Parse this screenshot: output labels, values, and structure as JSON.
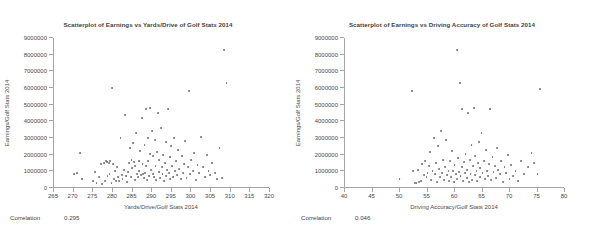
{
  "chart_data": [
    {
      "type": "scatter",
      "title": "Scatterplot of Earnings vs Yards/Drive of Golf Stats 2014",
      "xlabel": "Yards/Drive/Golf Stats 2014",
      "ylabel": "Earnings/Golf Stats 2014",
      "xlim": [
        265,
        320
      ],
      "ylim": [
        0,
        9000000
      ],
      "xticks": [
        265,
        270,
        275,
        280,
        285,
        290,
        295,
        300,
        305,
        310,
        315,
        320
      ],
      "yticks": [
        0,
        1000000,
        2000000,
        3000000,
        4000000,
        5000000,
        6000000,
        7000000,
        8000000,
        9000000
      ],
      "grid": false,
      "legend": "none",
      "correlation_label": "Correlation",
      "correlation_value": "0.295",
      "marker_color": "#6e6e6e",
      "points": [
        [
          270.4,
          820000
        ],
        [
          271.2,
          900000
        ],
        [
          271.9,
          2100000
        ],
        [
          272.4,
          560000
        ],
        [
          275.2,
          420000
        ],
        [
          275.6,
          960000
        ],
        [
          276.1,
          300000
        ],
        [
          276.8,
          690000
        ],
        [
          277.2,
          1450000
        ],
        [
          277.5,
          250000
        ],
        [
          277.9,
          1520000
        ],
        [
          278.2,
          430000
        ],
        [
          278.4,
          1600000
        ],
        [
          278.7,
          1580000
        ],
        [
          278.9,
          700000
        ],
        [
          279.2,
          1500000
        ],
        [
          279.4,
          850000
        ],
        [
          279.6,
          1620000
        ],
        [
          279.9,
          330000
        ],
        [
          280.1,
          6000000
        ],
        [
          280.3,
          1450000
        ],
        [
          280.6,
          560000
        ],
        [
          280.8,
          1000000
        ],
        [
          281.1,
          420000
        ],
        [
          281.4,
          1240000
        ],
        [
          281.6,
          640000
        ],
        [
          281.9,
          400000
        ],
        [
          282.2,
          3000000
        ],
        [
          282.5,
          800000
        ],
        [
          282.7,
          560000
        ],
        [
          283.0,
          1100000
        ],
        [
          283.3,
          4400000
        ],
        [
          283.5,
          700000
        ],
        [
          283.8,
          380000
        ],
        [
          284.1,
          950000
        ],
        [
          284.3,
          1500000
        ],
        [
          284.6,
          2400000
        ],
        [
          284.8,
          640000
        ],
        [
          285.0,
          1700000
        ],
        [
          285.2,
          1180000
        ],
        [
          285.4,
          2700000
        ],
        [
          285.6,
          1550000
        ],
        [
          285.8,
          500000
        ],
        [
          286.0,
          1350000
        ],
        [
          286.2,
          3300000
        ],
        [
          286.4,
          860000
        ],
        [
          286.6,
          640000
        ],
        [
          286.8,
          1650000
        ],
        [
          287.0,
          1000000
        ],
        [
          287.2,
          2200000
        ],
        [
          287.4,
          760000
        ],
        [
          287.6,
          4200000
        ],
        [
          287.8,
          1440000
        ],
        [
          288.0,
          820000
        ],
        [
          288.1,
          600000
        ],
        [
          288.3,
          2600000
        ],
        [
          288.5,
          900000
        ],
        [
          288.6,
          1300000
        ],
        [
          288.8,
          4750000
        ],
        [
          289.0,
          500000
        ],
        [
          289.1,
          3000000
        ],
        [
          289.3,
          1600000
        ],
        [
          289.5,
          720000
        ],
        [
          289.6,
          2050000
        ],
        [
          289.8,
          4800000
        ],
        [
          290.0,
          1100000
        ],
        [
          290.2,
          3450000
        ],
        [
          290.4,
          860000
        ],
        [
          290.5,
          1900000
        ],
        [
          290.7,
          640000
        ],
        [
          290.9,
          2900000
        ],
        [
          291.1,
          1300000
        ],
        [
          291.3,
          480000
        ],
        [
          291.5,
          2150000
        ],
        [
          291.7,
          4500000
        ],
        [
          291.9,
          960000
        ],
        [
          292.1,
          1700000
        ],
        [
          292.3,
          600000
        ],
        [
          292.5,
          3600000
        ],
        [
          292.7,
          1250000
        ],
        [
          292.9,
          820000
        ],
        [
          293.1,
          2000000
        ],
        [
          293.3,
          400000
        ],
        [
          293.5,
          1500000
        ],
        [
          293.7,
          2750000
        ],
        [
          293.9,
          700000
        ],
        [
          294.1,
          1100000
        ],
        [
          294.3,
          4750000
        ],
        [
          294.5,
          900000
        ],
        [
          294.7,
          1850000
        ],
        [
          294.9,
          520000
        ],
        [
          295.1,
          2500000
        ],
        [
          295.3,
          1350000
        ],
        [
          295.5,
          640000
        ],
        [
          295.8,
          3000000
        ],
        [
          296.0,
          1000000
        ],
        [
          296.3,
          1600000
        ],
        [
          296.6,
          760000
        ],
        [
          296.9,
          2300000
        ],
        [
          297.2,
          1150000
        ],
        [
          297.5,
          560000
        ],
        [
          297.8,
          1900000
        ],
        [
          298.1,
          900000
        ],
        [
          298.4,
          1450000
        ],
        [
          298.7,
          2800000
        ],
        [
          299.0,
          600000
        ],
        [
          299.3,
          1250000
        ],
        [
          299.6,
          5800000
        ],
        [
          299.9,
          820000
        ],
        [
          300.2,
          1700000
        ],
        [
          300.6,
          1000000
        ],
        [
          301.0,
          2100000
        ],
        [
          301.4,
          480000
        ],
        [
          301.8,
          1400000
        ],
        [
          302.3,
          900000
        ],
        [
          302.8,
          3050000
        ],
        [
          303.3,
          1250000
        ],
        [
          303.8,
          640000
        ],
        [
          304.2,
          2000000
        ],
        [
          304.6,
          1050000
        ],
        [
          305.1,
          760000
        ],
        [
          305.6,
          1500000
        ],
        [
          306.2,
          900000
        ],
        [
          306.8,
          560000
        ],
        [
          307.4,
          2400000
        ],
        [
          308.0,
          620000
        ],
        [
          308.6,
          8300000
        ],
        [
          309.2,
          6300000
        ]
      ]
    },
    {
      "type": "scatter",
      "title": "Scatterplot of Earnings vs Driving Accuracy of Golf Stats 2014",
      "xlabel": "Driving Accuracy/Golf Stats 2014",
      "ylabel": "Earnings/Golf Stats 2014",
      "xlim": [
        40,
        80
      ],
      "ylim": [
        0,
        9000000
      ],
      "xticks": [
        40,
        45,
        50,
        55,
        60,
        65,
        70,
        75,
        80
      ],
      "yticks": [
        0,
        1000000,
        2000000,
        3000000,
        4000000,
        5000000,
        6000000,
        7000000,
        8000000,
        9000000
      ],
      "grid": false,
      "legend": "none",
      "correlation_label": "Correlation",
      "correlation_value": "0.046",
      "marker_color": "#6e6e6e",
      "points": [
        [
          50.1,
          560000
        ],
        [
          52.3,
          5800000
        ],
        [
          52.6,
          1050000
        ],
        [
          52.9,
          330000
        ],
        [
          53.2,
          290000
        ],
        [
          53.5,
          1100000
        ],
        [
          53.7,
          380000
        ],
        [
          54.0,
          430000
        ],
        [
          54.2,
          1450000
        ],
        [
          54.5,
          760000
        ],
        [
          54.8,
          1600000
        ],
        [
          55.0,
          640000
        ],
        [
          55.2,
          900000
        ],
        [
          55.5,
          1350000
        ],
        [
          55.7,
          2150000
        ],
        [
          55.9,
          500000
        ],
        [
          56.1,
          1000000
        ],
        [
          56.3,
          3000000
        ],
        [
          56.5,
          820000
        ],
        [
          56.7,
          1500000
        ],
        [
          56.9,
          380000
        ],
        [
          57.1,
          2500000
        ],
        [
          57.3,
          1150000
        ],
        [
          57.5,
          640000
        ],
        [
          57.7,
          3450000
        ],
        [
          57.9,
          900000
        ],
        [
          58.0,
          1700000
        ],
        [
          58.2,
          480000
        ],
        [
          58.4,
          1250000
        ],
        [
          58.6,
          2900000
        ],
        [
          58.8,
          760000
        ],
        [
          59.0,
          1000000
        ],
        [
          59.1,
          420000
        ],
        [
          59.3,
          1600000
        ],
        [
          59.5,
          650000
        ],
        [
          59.7,
          2200000
        ],
        [
          59.8,
          1050000
        ],
        [
          60.0,
          350000
        ],
        [
          60.1,
          1400000
        ],
        [
          60.3,
          820000
        ],
        [
          60.5,
          8300000
        ],
        [
          60.6,
          560000
        ],
        [
          60.8,
          1800000
        ],
        [
          60.9,
          960000
        ],
        [
          61.1,
          6300000
        ],
        [
          61.2,
          700000
        ],
        [
          61.4,
          1250000
        ],
        [
          61.5,
          4750000
        ],
        [
          61.7,
          430000
        ],
        [
          61.8,
          1550000
        ],
        [
          62.0,
          900000
        ],
        [
          62.1,
          2050000
        ],
        [
          62.3,
          620000
        ],
        [
          62.4,
          1100000
        ],
        [
          62.6,
          4500000
        ],
        [
          62.7,
          340000
        ],
        [
          62.9,
          1700000
        ],
        [
          63.0,
          850000
        ],
        [
          63.2,
          2600000
        ],
        [
          63.3,
          500000
        ],
        [
          63.5,
          1300000
        ],
        [
          63.6,
          4800000
        ],
        [
          63.8,
          760000
        ],
        [
          63.9,
          1950000
        ],
        [
          64.1,
          1050000
        ],
        [
          64.2,
          400000
        ],
        [
          64.4,
          1500000
        ],
        [
          64.5,
          2750000
        ],
        [
          64.7,
          640000
        ],
        [
          64.8,
          1200000
        ],
        [
          65.0,
          3300000
        ],
        [
          65.2,
          880000
        ],
        [
          65.4,
          1650000
        ],
        [
          65.6,
          520000
        ],
        [
          65.8,
          2300000
        ],
        [
          66.0,
          1000000
        ],
        [
          66.2,
          700000
        ],
        [
          66.4,
          1450000
        ],
        [
          66.6,
          4750000
        ],
        [
          66.8,
          460000
        ],
        [
          67.0,
          1850000
        ],
        [
          67.2,
          950000
        ],
        [
          67.4,
          1300000
        ],
        [
          67.6,
          600000
        ],
        [
          67.8,
          2400000
        ],
        [
          68.0,
          1100000
        ],
        [
          68.3,
          820000
        ],
        [
          68.6,
          1600000
        ],
        [
          68.9,
          380000
        ],
        [
          69.2,
          1250000
        ],
        [
          69.5,
          900000
        ],
        [
          69.8,
          2000000
        ],
        [
          70.1,
          560000
        ],
        [
          70.4,
          1400000
        ],
        [
          70.8,
          700000
        ],
        [
          71.2,
          1050000
        ],
        [
          71.7,
          420000
        ],
        [
          72.2,
          1600000
        ],
        [
          72.8,
          820000
        ],
        [
          73.4,
          1250000
        ],
        [
          74.1,
          2100000
        ],
        [
          74.6,
          1500000
        ],
        [
          75.2,
          820000
        ],
        [
          75.6,
          5950000
        ]
      ]
    }
  ]
}
